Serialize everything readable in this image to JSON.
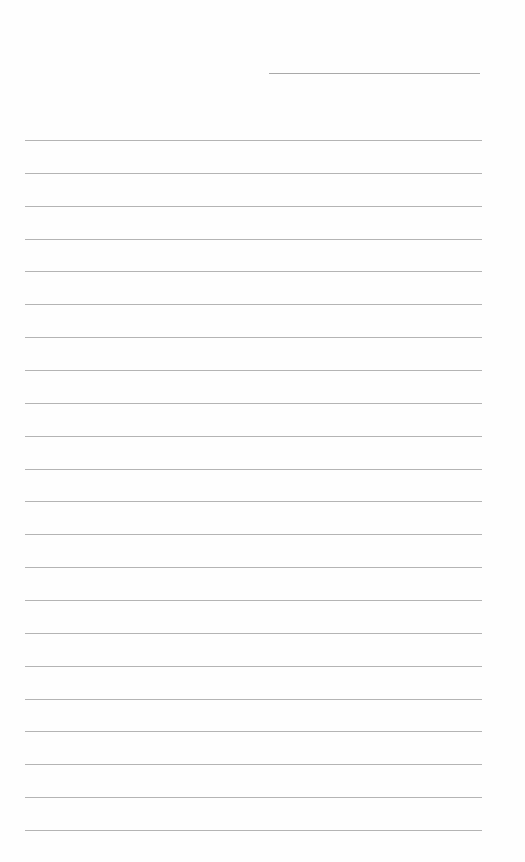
{
  "document": {
    "type": "lined-paper",
    "background_color": "#fefefe",
    "line_color": "#b4b4b4",
    "header_line": {
      "label": "",
      "color": "#a9a9a9"
    },
    "ruled_lines": {
      "count": 22,
      "first_y": 140,
      "spacing": 32.86
    }
  }
}
